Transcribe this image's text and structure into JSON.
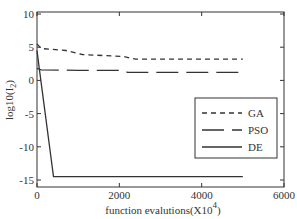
{
  "chart_data": {
    "type": "line",
    "title": "",
    "xlabel": "function evalutions(X10",
    "xlabel_superscript": "4",
    "xlabel_suffix": ")",
    "ylabel": "log10(I",
    "ylabel_subscript": "2",
    "ylabel_suffix": ")",
    "xlim": [
      0,
      6000
    ],
    "ylim": [
      -15.5,
      10
    ],
    "xticks": [
      0,
      2000,
      4000,
      6000
    ],
    "xtick_labels": [
      "0",
      "2000",
      "4000",
      "6000"
    ],
    "yticks": [
      10,
      5,
      0,
      -5,
      -10,
      -15
    ],
    "ytick_labels": [
      "10",
      "5",
      "0",
      "-5",
      "-10",
      "-15"
    ],
    "grid": false,
    "legend_position": "center right",
    "series": [
      {
        "name": "GA",
        "style": "dashed",
        "x": [
          0,
          100,
          700,
          1100,
          2100,
          2400,
          5000
        ],
        "y": [
          5.5,
          4.8,
          4.5,
          3.9,
          3.6,
          3.2,
          3.2
        ]
      },
      {
        "name": "PSO",
        "style": "long-dashed",
        "x": [
          0,
          100,
          1000,
          2100,
          2200,
          5000
        ],
        "y": [
          1.8,
          1.6,
          1.5,
          1.5,
          1.2,
          1.2
        ]
      },
      {
        "name": "DE",
        "style": "solid",
        "x": [
          0,
          50,
          400,
          5000
        ],
        "y": [
          4.5,
          2.0,
          -14.5,
          -14.5
        ]
      }
    ]
  },
  "legend": {
    "items": [
      {
        "label": "GA",
        "style": "dashed"
      },
      {
        "label": "PSO",
        "style": "long-dashed"
      },
      {
        "label": "DE",
        "style": "solid"
      }
    ]
  },
  "colors": {
    "line": "#333333",
    "axis": "#333333",
    "background": "#ffffff"
  }
}
